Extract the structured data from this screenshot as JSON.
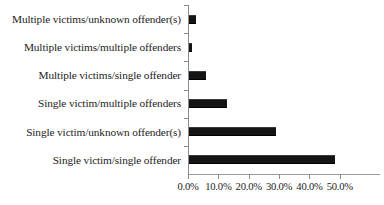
{
  "chart_data": {
    "type": "bar",
    "orientation": "horizontal",
    "title": "",
    "subtitle": "",
    "xlabel": "",
    "ylabel": "",
    "categories": [
      "Multiple victims/unknown offender(s)",
      "Multiple victims/multiple offenders",
      "Multiple victims/single offender",
      "Single victim/multiple offenders",
      "Single victim/unknown offender(s)",
      "Single victim/single offender"
    ],
    "values": [
      2.2,
      1.0,
      5.6,
      12.5,
      28.5,
      48.0
    ],
    "value_suffix": "%",
    "xlim": [
      0,
      55
    ],
    "xticks": [
      0,
      10,
      20,
      30,
      40,
      50
    ],
    "xtick_labels": [
      "0.0%",
      "10.0%",
      "20.0%",
      "30.0%",
      "40.0%",
      "50.0%"
    ],
    "grid": false,
    "legend": null,
    "legend_position": "none",
    "bar_color": "#141414",
    "axis_color": "#8c8c8c",
    "background_color": "#ffffff"
  }
}
